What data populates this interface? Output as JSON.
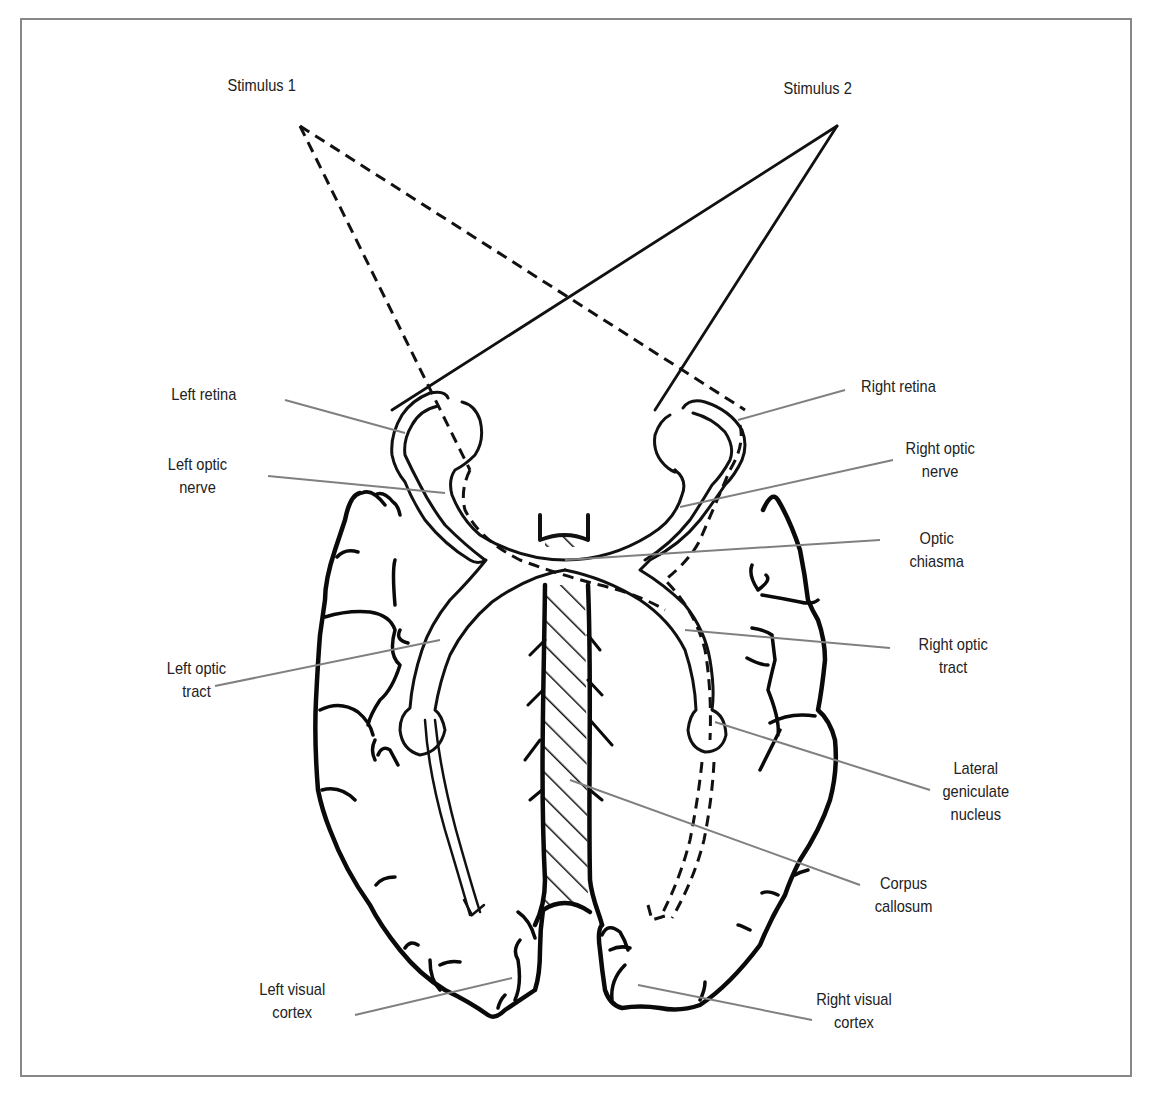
{
  "figure": {
    "caption": "",
    "stimuli": [
      {
        "id": "stimulus-1",
        "label": "Stimulus 1",
        "line_style": "dashed"
      },
      {
        "id": "stimulus-2",
        "label": "Stimulus 2",
        "line_style": "solid"
      }
    ],
    "labels": {
      "left_retina": [
        "Left retina"
      ],
      "left_optic_nerve": [
        "Left optic",
        "nerve"
      ],
      "left_optic_tract": [
        "Left optic",
        "tract"
      ],
      "left_visual_cortex": [
        "Left visual",
        "cortex"
      ],
      "right_retina": [
        "Right retina"
      ],
      "right_optic_nerve": [
        "Right optic",
        "nerve"
      ],
      "optic_chiasma": [
        "Optic",
        "chiasma"
      ],
      "right_optic_tract": [
        "Right optic",
        "tract"
      ],
      "lateral_geniculate_nucleus": [
        "Lateral",
        "geniculate",
        "nucleus"
      ],
      "corpus_callosum": [
        "Corpus",
        "callosum"
      ],
      "right_visual_cortex": [
        "Right visual",
        "cortex"
      ]
    },
    "colors": {
      "outline": "#111111",
      "leader_line": "#808080",
      "frame": "#888888",
      "text": "#222222",
      "background": "#ffffff"
    }
  }
}
